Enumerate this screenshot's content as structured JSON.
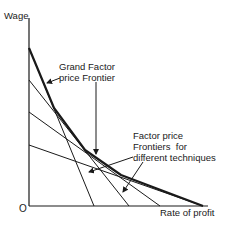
{
  "diagram": {
    "y_axis_label": "Wage",
    "x_axis_label": "Rate of profit",
    "origin_label": "O",
    "annotations": {
      "grand_frontier": {
        "line1": "Grand Factor",
        "line2": "price Frontier"
      },
      "technique_frontiers": {
        "line1": "Factor price",
        "line2": "Frontiers  for",
        "line3": "different techniques"
      }
    },
    "techniques": [
      {
        "name": "technique-1",
        "wage_intercept_px": 48,
        "profit_intercept_px": 94
      },
      {
        "name": "technique-2",
        "wage_intercept_px": 80,
        "profit_intercept_px": 129
      },
      {
        "name": "technique-3",
        "wage_intercept_px": 112,
        "profit_intercept_px": 160
      },
      {
        "name": "technique-4",
        "wage_intercept_px": 145,
        "profit_intercept_px": 203
      }
    ],
    "colors": {
      "ink": "#1a1a1a",
      "background": "#ffffff"
    }
  }
}
